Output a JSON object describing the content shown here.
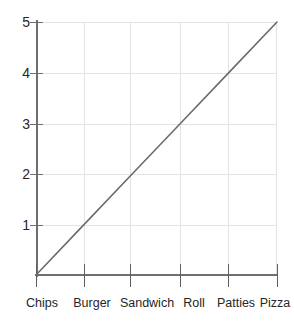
{
  "chart_data": {
    "type": "line",
    "title": "",
    "subtitle": "",
    "xlabel": "",
    "ylabel": "",
    "categories": [
      "Chips",
      "Burger",
      "Sandwich",
      "Roll",
      "Patties",
      "Pizza"
    ],
    "x_tick_labels": [
      "Chips",
      "Burger",
      "Sandwich",
      "Roll",
      "Patties",
      "Pizza"
    ],
    "values": [
      0,
      1,
      2,
      3,
      4,
      5
    ],
    "series": [
      {
        "name": "",
        "values": [
          0,
          1,
          2,
          3,
          4,
          5
        ]
      }
    ],
    "y_tick_labels": [
      "1",
      "2",
      "3",
      "4",
      "5"
    ],
    "y_ticks": [
      1,
      2,
      3,
      4,
      5
    ],
    "ylim": [
      0,
      5
    ],
    "xlim_categories": 6,
    "grid": true,
    "grid_horizontal": true,
    "grid_vertical": true,
    "legend": false,
    "legend_position": "none",
    "line_color": "#6b6b6b",
    "grid_color": "#e3e3e3",
    "axis_color": "#6e6e6e",
    "text_color": "#262626",
    "background_color": "#ffffff",
    "markers": false,
    "annotations": []
  }
}
